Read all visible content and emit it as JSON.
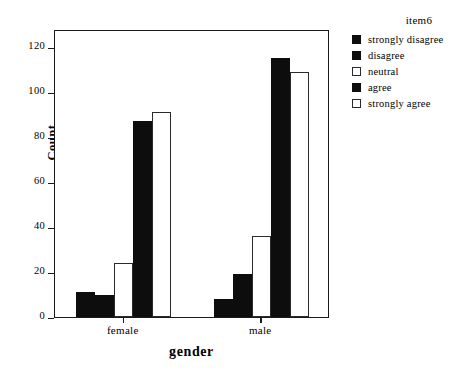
{
  "chart_data": {
    "type": "bar",
    "title": "",
    "xlabel": "gender",
    "ylabel": "Count",
    "categories": [
      "female",
      "male"
    ],
    "legend_title": "item6",
    "legend_position": "right",
    "grid": false,
    "ylim": [
      0,
      128
    ],
    "yticks": [
      0,
      20,
      40,
      60,
      80,
      100,
      120
    ],
    "ytick_labels": [
      "0",
      "20",
      "40",
      "60",
      "80",
      "100",
      "120"
    ],
    "series": [
      {
        "name": "strongly disagree",
        "fill": "dark",
        "color": "#0d0d0d",
        "values": [
          11,
          8
        ]
      },
      {
        "name": "disagree",
        "fill": "dark",
        "color": "#0d0d0d",
        "values": [
          10,
          19
        ]
      },
      {
        "name": "neutral",
        "fill": "light",
        "color": "#ffffff",
        "values": [
          24,
          36
        ]
      },
      {
        "name": "agree",
        "fill": "dark",
        "color": "#0d0d0d",
        "values": [
          87,
          115
        ]
      },
      {
        "name": "strongly agree",
        "fill": "light",
        "color": "#ffffff",
        "values": [
          91,
          109
        ]
      }
    ]
  }
}
